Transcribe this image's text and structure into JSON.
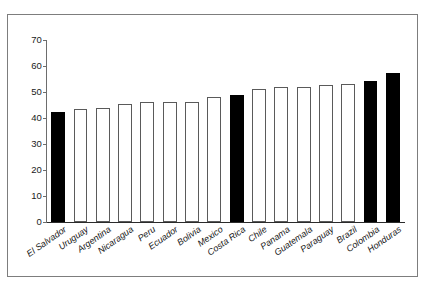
{
  "chart_data": {
    "type": "bar",
    "title": "",
    "subtitle": "",
    "xlabel": "",
    "ylabel": "",
    "ylim": [
      0,
      70
    ],
    "yticks": [
      0,
      10,
      20,
      30,
      40,
      50,
      60,
      70
    ],
    "grid": false,
    "legend": null,
    "categories": [
      "El Salvador",
      "Uruguay",
      "Argentina",
      "Nicaragua",
      "Peru",
      "Ecuador",
      "Bolivia",
      "Mexico",
      "Costa Rica",
      "Chile",
      "Panama",
      "Guatemala",
      "Paraguay",
      "Brazil",
      "Colombia",
      "Honduras"
    ],
    "values": [
      42.3,
      43.5,
      43.8,
      45.3,
      46.2,
      46.2,
      46.2,
      48.0,
      49.0,
      51.3,
      52.0,
      52.0,
      52.6,
      53.0,
      54.2,
      57.5
    ],
    "highlighted": [
      "El Salvador",
      "Costa Rica",
      "Colombia",
      "Honduras"
    ],
    "colors": {
      "bar_fill_default": "#ffffff",
      "bar_edge_default": "#5a5a5a",
      "bar_fill_highlight": "#000000",
      "axis": "#2b2b2b",
      "text": "#141414",
      "frame": "#7d7d7d",
      "background": "#ffffff"
    }
  }
}
